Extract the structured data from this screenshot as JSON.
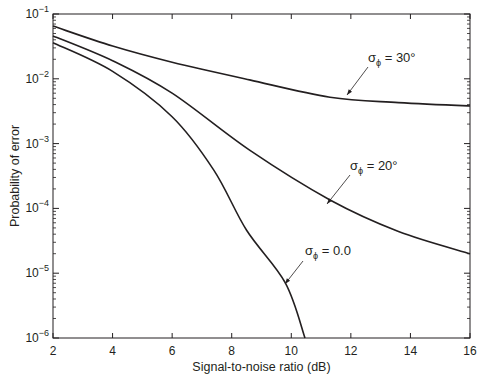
{
  "chart_data": {
    "type": "line",
    "title": "",
    "xlabel": "Signal-to-noise ratio (dB)",
    "ylabel": "Probability of error",
    "xlim": [
      2,
      16
    ],
    "ylim": [
      1e-06,
      0.1
    ],
    "yscale": "log",
    "grid": false,
    "legend": "none (inline annotations with arrows)",
    "x_ticks": [
      2,
      4,
      6,
      8,
      10,
      12,
      14,
      16
    ],
    "x_tick_labels": [
      "2",
      "4",
      "6",
      "8",
      "10",
      "12",
      "14",
      "16"
    ],
    "y_ticks": [
      1e-06,
      1e-05,
      0.0001,
      0.001,
      0.01,
      0.1
    ],
    "y_tick_labels": [
      {
        "base": "10",
        "exp": "−6"
      },
      {
        "base": "10",
        "exp": "−5"
      },
      {
        "base": "10",
        "exp": "−4"
      },
      {
        "base": "10",
        "exp": "−3"
      },
      {
        "base": "10",
        "exp": "−2"
      },
      {
        "base": "10",
        "exp": "−1"
      }
    ],
    "series": [
      {
        "name": "σφ = 30°",
        "label_main": "σ",
        "label_sub": "ϕ",
        "label_rest": " = 30°",
        "x": [
          2,
          4,
          6,
          8.6,
          11.3,
          13.6,
          16
        ],
        "values": [
          0.065,
          0.032,
          0.018,
          0.0096,
          0.0052,
          0.0043,
          0.0038
        ],
        "annotation": {
          "text_x": 368,
          "text_y": 62,
          "arrow_from": [
            368,
            67
          ],
          "arrow_to": [
            347,
            95
          ]
        }
      },
      {
        "name": "σφ = 20°",
        "label_main": "σ",
        "label_sub": "ϕ",
        "label_rest": " = 20°",
        "x": [
          2,
          4,
          6,
          8.6,
          11.3,
          13.6,
          16
        ],
        "values": [
          0.046,
          0.019,
          0.006,
          0.00079,
          0.000135,
          4.4e-05,
          2e-05
        ],
        "annotation": {
          "text_x": 350,
          "text_y": 170,
          "arrow_from": [
            350,
            175
          ],
          "arrow_to": [
            327,
            204
          ]
        }
      },
      {
        "name": "σφ = 0.0",
        "label_main": "σ",
        "label_sub": "ϕ",
        "label_rest": " = 0.0",
        "x": [
          2,
          4,
          6,
          7.4,
          8.5,
          9.8,
          10.46
        ],
        "values": [
          0.036,
          0.013,
          0.0026,
          0.00039,
          4.6e-05,
          7.1e-06,
          1e-06
        ],
        "annotation": {
          "text_x": 305,
          "text_y": 255,
          "arrow_from": [
            303,
            261
          ],
          "arrow_to": [
            285,
            284
          ]
        }
      }
    ],
    "line_color": "#231f20"
  }
}
